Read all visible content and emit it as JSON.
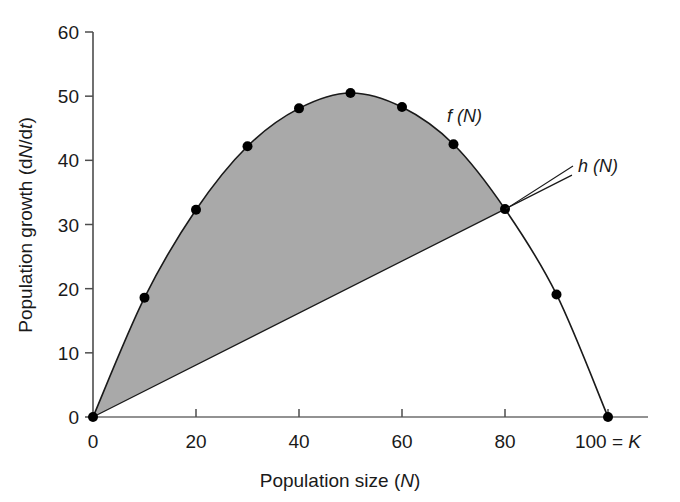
{
  "chart_data": {
    "type": "line",
    "title": "",
    "subtitle": "",
    "xlabel": "Population size (N)",
    "ylabel": "Population growth (dN/dt)",
    "xlim": [
      0,
      100
    ],
    "ylim": [
      0,
      60
    ],
    "grid": false,
    "legend_position": "inline-annotations",
    "x_ticks": [
      {
        "value": 0,
        "label": "0"
      },
      {
        "value": 20,
        "label": "20"
      },
      {
        "value": 40,
        "label": "40"
      },
      {
        "value": 60,
        "label": "60"
      },
      {
        "value": 80,
        "label": "80"
      },
      {
        "value": 100,
        "label": "100 = K"
      }
    ],
    "y_ticks": [
      {
        "value": 0,
        "label": "0"
      },
      {
        "value": 10,
        "label": "10"
      },
      {
        "value": 20,
        "label": "20"
      },
      {
        "value": 30,
        "label": "30"
      },
      {
        "value": 40,
        "label": "40"
      },
      {
        "value": 50,
        "label": "50"
      },
      {
        "value": 60,
        "label": "60"
      }
    ],
    "series": [
      {
        "name": "f (N)",
        "label": "f (N)",
        "style": "curve-with-markers",
        "marker": "filled-circle",
        "x": [
          0,
          10,
          20,
          30,
          40,
          50,
          60,
          70,
          80,
          90,
          100
        ],
        "values": [
          0,
          18.6,
          32.3,
          42.2,
          48.1,
          50.5,
          48.3,
          42.5,
          32.4,
          19.1,
          0
        ]
      },
      {
        "name": "h (N)",
        "label": "h (N)",
        "style": "straight-line",
        "marker": "none",
        "x": [
          0,
          80,
          93
        ],
        "values": [
          0,
          32.4,
          37.7
        ]
      }
    ],
    "shaded_region": {
      "name": "surplus-yield-area",
      "between": [
        "f (N)",
        "h (N)"
      ],
      "x_range": [
        0,
        80
      ],
      "color": "#a9a9a9"
    },
    "annotations": [
      {
        "name": "f-label",
        "text": "f (N)",
        "x": 73,
        "y": 44.5
      },
      {
        "name": "h-label",
        "text": "h (N)",
        "x": 96,
        "y": 39.0
      }
    ],
    "axis_color": "#4d4d4d",
    "curve_color": "#1a1a1a",
    "marker_color": "#000000"
  }
}
